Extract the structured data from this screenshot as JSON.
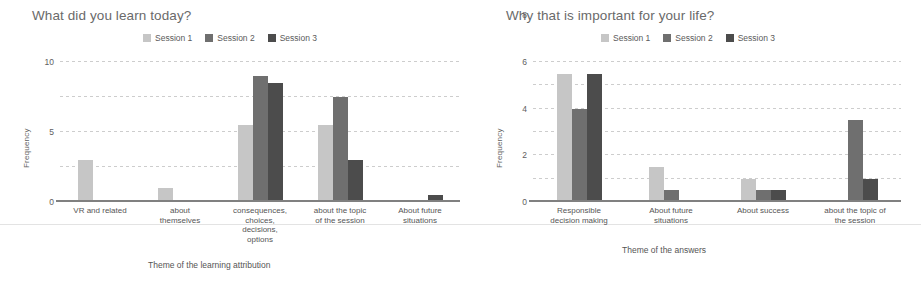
{
  "colors": {
    "session1": "#c6c6c6",
    "session2": "#6f6f6f",
    "session3": "#4c4c4c",
    "grid": "#cdcdcd",
    "axis": "#808080",
    "text": "#595959"
  },
  "legend": {
    "items": [
      {
        "label": "Session 1",
        "color": "#c6c6c6"
      },
      {
        "label": "Session 2",
        "color": "#6f6f6f"
      },
      {
        "label": "Session 3",
        "color": "#4c4c4c"
      }
    ]
  },
  "chart_data": [
    {
      "type": "bar",
      "title": "What did you learn today?",
      "xlabel": "Theme of the learning attribution",
      "ylabel": "Frequency",
      "ylim": [
        0,
        20
      ],
      "yticks": [
        0,
        5,
        10,
        15,
        20
      ],
      "grid": true,
      "legend_position": "top-center",
      "categories": [
        "VR and related",
        "about themselves",
        "consequences, choices, decisions, options",
        "about the topic of the session",
        "About future situations"
      ],
      "category_lines": [
        [
          "VR and related"
        ],
        [
          "about",
          "themselves"
        ],
        [
          "consequences,",
          "choices,",
          "decisions,",
          "options"
        ],
        [
          "about the topic",
          "of the session"
        ],
        [
          "About future",
          "situations"
        ]
      ],
      "series": [
        {
          "name": "Session 1",
          "values": [
            6,
            2,
            11,
            11,
            0
          ]
        },
        {
          "name": "Session 2",
          "values": [
            0,
            0,
            18,
            15,
            0
          ]
        },
        {
          "name": "Session 3",
          "values": [
            0,
            0,
            17,
            6,
            1
          ]
        }
      ]
    },
    {
      "type": "bar",
      "title": "Why that is important for your life?",
      "xlabel": "Theme of the answers",
      "ylabel": "Frequency",
      "ylim": [
        0,
        12
      ],
      "yticks": [
        0,
        2,
        4,
        6,
        8,
        10,
        12
      ],
      "grid": true,
      "legend_position": "top-center",
      "categories": [
        "Responsible decision making",
        "About future situations",
        "About success",
        "about the topic of the session"
      ],
      "category_lines": [
        [
          "Responsible",
          "decision making"
        ],
        [
          "About future",
          "situations"
        ],
        [
          "About success"
        ],
        [
          "about the topic of",
          "the session"
        ]
      ],
      "series": [
        {
          "name": "Session 1",
          "values": [
            11,
            3,
            2,
            0
          ]
        },
        {
          "name": "Session 2",
          "values": [
            8,
            1,
            1,
            7
          ]
        },
        {
          "name": "Session 3",
          "values": [
            11,
            0,
            1,
            2
          ]
        }
      ]
    }
  ]
}
